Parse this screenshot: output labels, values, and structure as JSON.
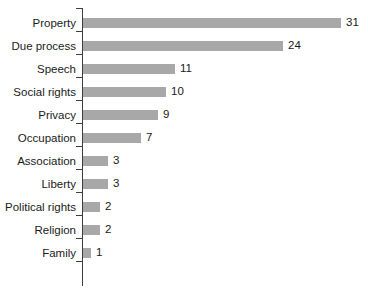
{
  "chart_data": {
    "type": "bar",
    "orientation": "horizontal",
    "title": "",
    "subtitle": "",
    "xlabel": "",
    "ylabel": "",
    "categories": [
      "Property",
      "Due process",
      "Speech",
      "Social rights",
      "Privacy",
      "Occupation",
      "Association",
      "Liberty",
      "Political rights",
      "Religion",
      "Family"
    ],
    "values": [
      31,
      24,
      11,
      10,
      9,
      7,
      3,
      3,
      2,
      2,
      1
    ],
    "value_labels": [
      "31",
      "24",
      "11",
      "10",
      "9",
      "7",
      "3",
      "3",
      "2",
      "2",
      "1"
    ],
    "xlim": [
      0,
      34
    ],
    "grid": false,
    "legend": null,
    "annotations": [],
    "colors": {
      "bar": "#a8a8a8",
      "axis": "#3d3d3d",
      "text": "#1a1a1a",
      "background": "#ffffff"
    },
    "px_per_unit": 8.32,
    "bar_origin_x": 83
  }
}
